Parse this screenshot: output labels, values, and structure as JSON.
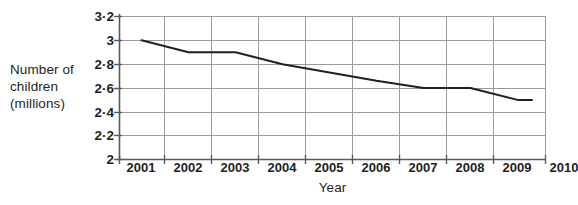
{
  "chart_data": {
    "type": "line",
    "title": "",
    "xlabel": "Year",
    "ylabel": "Number of children (millions)",
    "ylabel_lines": [
      "Number of",
      "children",
      "(millions)"
    ],
    "categories": [
      "2001",
      "2002",
      "2003",
      "2004",
      "2005",
      "2006",
      "2007",
      "2008",
      "2009",
      "2010"
    ],
    "x": [
      2001,
      2002,
      2003,
      2004,
      2005,
      2006,
      2007,
      2008,
      2009,
      2010
    ],
    "values": [
      3.0,
      2.9,
      2.9,
      2.8,
      2.73,
      2.66,
      2.6,
      2.6,
      2.5,
      2.5
    ],
    "series": [
      {
        "name": "Number of children (millions)",
        "values": [
          3.0,
          2.9,
          2.9,
          2.8,
          2.73,
          2.66,
          2.6,
          2.6,
          2.5,
          2.5
        ]
      }
    ],
    "ylim": [
      2,
      3.2
    ],
    "xlim": [
      2000.5,
      2010.5
    ],
    "yticks": [
      2,
      2.2,
      2.4,
      2.6,
      2.8,
      3,
      3.2
    ],
    "ytick_labels": [
      "2",
      "2·2",
      "2·4",
      "2·6",
      "2·8",
      "3",
      "3·2"
    ],
    "xtick_labels": [
      "2001",
      "2002",
      "2003",
      "2004",
      "2005",
      "2006",
      "2007",
      "2008",
      "2009",
      "2010"
    ],
    "grid": true,
    "grid_x": true,
    "grid_y": true,
    "legend": false,
    "legend_position": "none",
    "line_color": "#231f20",
    "grid_color": "#9a9a9a",
    "axis_color": "#58595b",
    "background_color": "#ffffff"
  }
}
